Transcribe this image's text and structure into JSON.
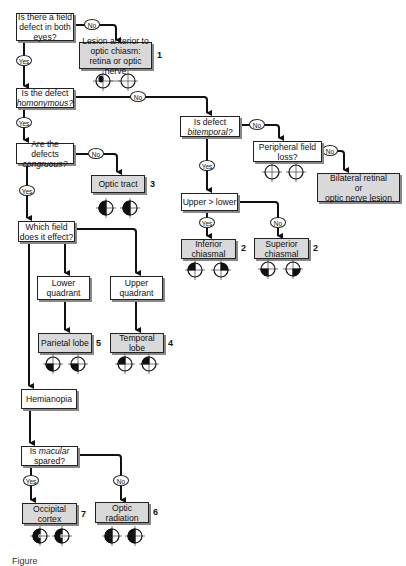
{
  "diagram": {
    "nodes": {
      "q_both_eyes": {
        "text": "Is there a field defect in both eyes?"
      },
      "r_anterior": {
        "text": "Lesion anterior to optic chiasm: retina or optic nerve",
        "number": "1",
        "fields": [
          "small-central-scotoma-left",
          "normal-right"
        ]
      },
      "q_homonymous": {
        "text_pre": "Is the defect",
        "text_em": "homonymous?"
      },
      "q_bitemporal": {
        "text_pre": "Is defect",
        "text_em": "bitemporal?"
      },
      "q_peripheral": {
        "text": "Peripheral field loss?",
        "fields": [
          "normal",
          "normal"
        ]
      },
      "r_bilateral": {
        "text1": "Bilateral retinal",
        "text2": "or",
        "text3": "optic nerve lesion"
      },
      "q_upper_lower": {
        "text": "Upper > lower"
      },
      "r_inferior_chiasmal": {
        "text": "Inferior chiasmal",
        "number": "2",
        "fields": [
          "upper-left-dark",
          "upper-right-dark"
        ]
      },
      "r_superior_chiasmal": {
        "text": "Superior chiasmal",
        "number": "2",
        "fields": [
          "lower-left-dark",
          "lower-right-dark"
        ]
      },
      "q_congruous": {
        "text_pre": "Are the defects",
        "text_em": "congruous?"
      },
      "r_optic_tract": {
        "text": "Optic tract",
        "number": "3",
        "fields": [
          "left-half-dark",
          "left-half-dark"
        ]
      },
      "q_which_field": {
        "text": "Which field does it effect?"
      },
      "lower_quadrant": {
        "text": "Lower quadrant"
      },
      "upper_quadrant": {
        "text": "Upper quadrant"
      },
      "r_parietal": {
        "text": "Parietal lobe",
        "number": "5",
        "fields": [
          "lower-left-dark",
          "lower-left-dark"
        ]
      },
      "r_temporal": {
        "text": "Temporal lobe",
        "number": "4",
        "fields": [
          "upper-left-dark",
          "upper-left-dark"
        ]
      },
      "hemianopia": {
        "text": "Hemianopia"
      },
      "q_macular": {
        "text_pre": "Is",
        "text_em": "macular",
        "text_post": "spared?"
      },
      "r_occipital": {
        "text": "Occipital cortex",
        "number": "7",
        "fields": [
          "left-half-dark-macular-sparing",
          "left-half-dark-macular-sparing"
        ]
      },
      "r_optic_radiation": {
        "text": "Optic radiation",
        "number": "6",
        "fields": [
          "left-half-dark",
          "left-half-dark"
        ]
      }
    },
    "edge_labels": {
      "yes": "Yes",
      "no": "No"
    },
    "caption": "Figure"
  }
}
